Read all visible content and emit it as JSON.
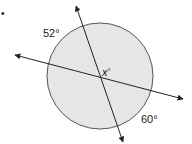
{
  "diagram": {
    "type": "circle-with-intersecting-secant-lines",
    "bullet": "•",
    "circle": {
      "cx": 100,
      "cy": 76,
      "r": 53,
      "fill": "#e6e6e6",
      "stroke": "#555555"
    },
    "lines": [
      {
        "name": "secant-line-steep",
        "x1": 76,
        "y1": 6,
        "x2": 123,
        "y2": 142
      },
      {
        "name": "secant-line-shallow",
        "x1": 15,
        "y1": 55,
        "x2": 183,
        "y2": 99
      }
    ],
    "line_color": "#222222",
    "labels": {
      "arc_top_left": "52°",
      "angle_unknown_var": "x",
      "angle_unknown_deg": "°",
      "arc_bottom_right": "60°"
    }
  }
}
